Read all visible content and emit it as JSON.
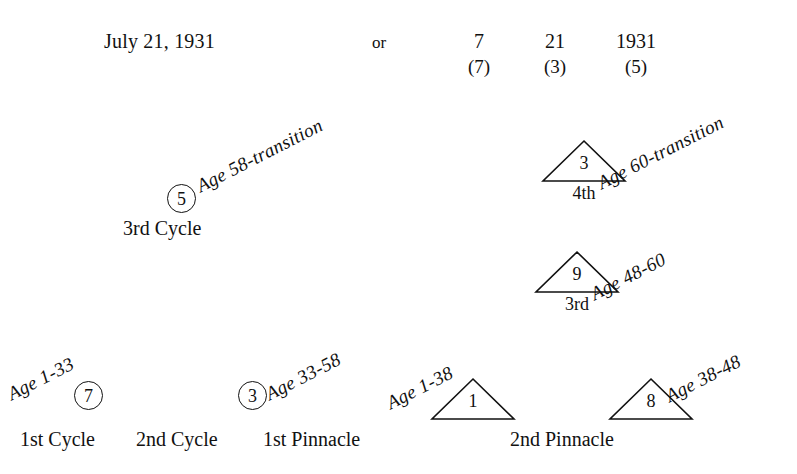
{
  "header": {
    "birth_date": "July 21, 1931",
    "connector": "or",
    "components": [
      {
        "value": "7",
        "reduced": "(7)"
      },
      {
        "value": "21",
        "reduced": "(3)"
      },
      {
        "value": "1931",
        "reduced": "(5)"
      }
    ]
  },
  "cycles": [
    {
      "number": "7",
      "age_label": "Age 1-33",
      "caption": "1st Cycle"
    },
    {
      "number": "3",
      "age_label": "Age 33-58",
      "caption": "2nd Cycle"
    },
    {
      "number": "5",
      "age_label": "Age 58-transition",
      "caption": "3rd Cycle"
    }
  ],
  "pinnacles": [
    {
      "number": "1",
      "age_label": "Age 1-38",
      "caption": "1st Pinnacle",
      "sub_caption": ""
    },
    {
      "number": "8",
      "age_label": "Age 38-48",
      "caption": "2nd Pinnacle",
      "sub_caption": ""
    },
    {
      "number": "9",
      "age_label": "Age 48-60",
      "caption": "",
      "sub_caption": "3rd"
    },
    {
      "number": "3",
      "age_label": "Age 60-transition",
      "caption": "",
      "sub_caption": "4th"
    }
  ],
  "colors": {
    "ink": "#111111",
    "background": "#ffffff"
  }
}
